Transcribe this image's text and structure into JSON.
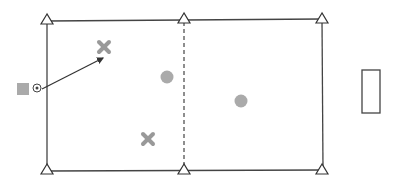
{
  "diagram": {
    "type": "soccer-drill-field",
    "colors": {
      "line": "#333333",
      "player_fill": "#aaaaaa",
      "defender_fill": "#aaaaaa",
      "background": "#ffffff"
    },
    "field": {
      "left_zone": {
        "x1": 47,
        "y1": 20,
        "x2": 184,
        "y2": 170
      },
      "right_zone": {
        "x1": 184,
        "y1": 20,
        "x2": 322,
        "y2": 170
      },
      "divider": "dashed"
    },
    "cones": [
      {
        "x": 47,
        "y": 20
      },
      {
        "x": 184,
        "y": 19
      },
      {
        "x": 322,
        "y": 18
      },
      {
        "x": 47,
        "y": 170
      },
      {
        "x": 184,
        "y": 170
      },
      {
        "x": 322,
        "y": 170
      }
    ],
    "attackers": [
      {
        "x": 104,
        "y": 47,
        "shape": "x"
      },
      {
        "x": 148,
        "y": 139,
        "shape": "x"
      }
    ],
    "defenders": [
      {
        "x": 167,
        "y": 77,
        "shape": "circle"
      },
      {
        "x": 241,
        "y": 101,
        "shape": "circle"
      }
    ],
    "server": {
      "x": 23,
      "y": 89,
      "shape": "square",
      "has_ball": true
    },
    "pass_arrow": {
      "from": [
        42,
        89
      ],
      "to": [
        104,
        57
      ]
    },
    "goal": {
      "x": 362,
      "y": 70,
      "width": 18,
      "height": 43
    }
  }
}
